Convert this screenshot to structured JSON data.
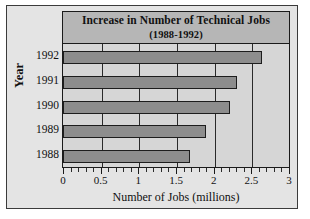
{
  "chart_data": {
    "type": "bar",
    "orientation": "horizontal",
    "title": "Increase in Number of Technical Jobs",
    "subtitle": "(1988-1992)",
    "xlabel": "Number of Jobs (millions)",
    "ylabel": "Year",
    "categories": [
      "1992",
      "1991",
      "1990",
      "1989",
      "1988"
    ],
    "values": [
      2.63,
      2.3,
      2.2,
      1.88,
      1.67
    ],
    "xlim": [
      0,
      3
    ],
    "xticks": [
      "0",
      "0.5",
      "1",
      "1.5",
      "2",
      "2.5",
      "3"
    ],
    "xtick_values": [
      0,
      0.5,
      1,
      1.5,
      2,
      2.5,
      3
    ],
    "minor_tick_step": 0.1,
    "grid": true,
    "legend": "none",
    "colors": {
      "bar_fill": "#8d8d8d",
      "bar_edge": "#1d1d1d",
      "plot_background": "#d6d6d6",
      "title_background": "#b6b6b6",
      "figure_background": "#e4e4e4",
      "frame": "#3b3b3b",
      "text": "#111111"
    }
  }
}
